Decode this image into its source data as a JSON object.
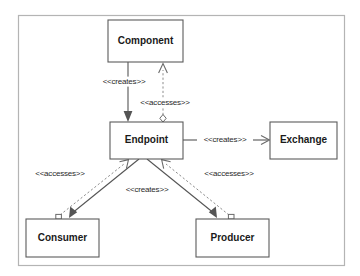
{
  "diagram": {
    "type": "uml-class-diagram",
    "frame": {
      "x": 18,
      "y": 15,
      "width": 327,
      "height": 251,
      "stroke": "#b4b4b4",
      "fill": "#ffffff"
    },
    "colors": {
      "background": "#ffffff",
      "box_stroke": "#5b5b5b",
      "box_fill": "#ffffff",
      "solid_edge": "#555555",
      "dashed_edge": "#8d8d8d",
      "text": "#1a1a1a",
      "label_text": "#2a2a2a",
      "frame_stroke": "#b4b4b4"
    },
    "nodes": [
      {
        "id": "component",
        "label": "Component",
        "x": 108,
        "y": 20,
        "width": 75,
        "height": 42
      },
      {
        "id": "endpoint",
        "label": "Endpoint",
        "x": 110,
        "y": 122,
        "width": 73,
        "height": 37
      },
      {
        "id": "exchange",
        "label": "Exchange",
        "x": 270,
        "y": 122,
        "width": 67,
        "height": 37
      },
      {
        "id": "consumer",
        "label": "Consumer",
        "x": 26,
        "y": 219,
        "width": 73,
        "height": 38
      },
      {
        "id": "producer",
        "label": "Producer",
        "x": 196,
        "y": 219,
        "width": 73,
        "height": 38
      }
    ],
    "edges": [
      {
        "id": "component-creates-endpoint",
        "label": "<<creates>>",
        "from": "component",
        "to": "endpoint",
        "style": "solid",
        "arrow": "filled",
        "label_x": 124,
        "label_y": 82
      },
      {
        "id": "endpoint-accesses-component",
        "label": "<<accesses>>",
        "from": "endpoint",
        "to": "component",
        "style": "dashed",
        "arrow": "open",
        "source_glyph": "diamond",
        "label_x": 165,
        "label_y": 103
      },
      {
        "id": "endpoint-creates-exchange",
        "label": "<<creates>>",
        "from": "endpoint",
        "to": "exchange",
        "style": "solid",
        "arrow": "open",
        "label_x": 225,
        "label_y": 140
      },
      {
        "id": "endpoint-creates-consumer-producer",
        "label": "<<creates>>",
        "from": "endpoint",
        "to": "consumer",
        "style": "solid",
        "arrow": "filled",
        "label_x": 147,
        "label_y": 190
      },
      {
        "id": "consumer-accesses-endpoint",
        "label": "<<accesses>>",
        "from": "consumer",
        "to": "endpoint",
        "style": "dashed",
        "arrow": "open",
        "source_glyph": "square",
        "label_x": 60,
        "label_y": 174
      },
      {
        "id": "producer-accesses-endpoint",
        "label": "<<accesses>>",
        "from": "producer",
        "to": "endpoint",
        "style": "dashed",
        "arrow": "open",
        "source_glyph": "square",
        "label_x": 229,
        "label_y": 174
      }
    ]
  }
}
